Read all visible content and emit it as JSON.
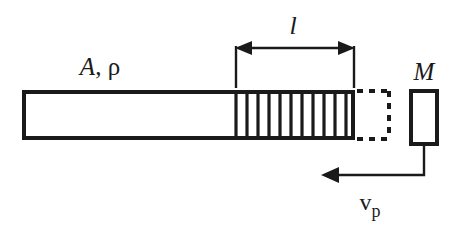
{
  "figure": {
    "type": "engineering-schematic",
    "background_color": "#ffffff",
    "ink_color": "#1a1a1a"
  },
  "labels": {
    "bar_properties": {
      "text": "A, ρ",
      "area_symbol": "A",
      "separator": ", ",
      "density_symbol": "ρ",
      "x": 100,
      "y": 74
    },
    "wave_length": {
      "text": "l",
      "x": 293,
      "y": 34
    },
    "mass": {
      "text": "M",
      "x": 424,
      "y": 78
    },
    "velocity": {
      "base": "v",
      "subscript": "p",
      "text": "v_p",
      "x": 375,
      "y": 212
    }
  },
  "bar": {
    "name": "elastic-bar",
    "x": 22,
    "y": 90,
    "width": 333,
    "height": 50,
    "stroke_width": 4,
    "fill": "#ffffff"
  },
  "hatch_zone": {
    "name": "compression-wave-zone",
    "x_start": 235,
    "x_end": 355,
    "line_count": 11,
    "stroke_width": 3.2
  },
  "dashed_ghost": {
    "name": "displaced-bar-end-outline",
    "x": 362,
    "y": 90,
    "width": 30,
    "height": 50,
    "stroke_width": 4,
    "dash_pattern": "6 6"
  },
  "mass_block": {
    "name": "impacting-mass",
    "x": 410,
    "y": 90,
    "width": 28,
    "height": 55,
    "stroke_width": 4,
    "fill": "#ffffff"
  },
  "dimension": {
    "name": "length-dimension",
    "line_y": 48,
    "x_left": 235,
    "x_right": 355,
    "extension_top": 48,
    "extension_bottom": 88,
    "stroke_width": 2.4,
    "arrow_size": 13
  },
  "velocity_arrow": {
    "name": "velocity-vector",
    "from_x": 424,
    "from_y": 145,
    "corner_x": 424,
    "corner_y": 175,
    "tip_x": 322,
    "tip_y": 175,
    "stroke_width": 2.4,
    "arrow_size": 13,
    "direction": "left"
  }
}
